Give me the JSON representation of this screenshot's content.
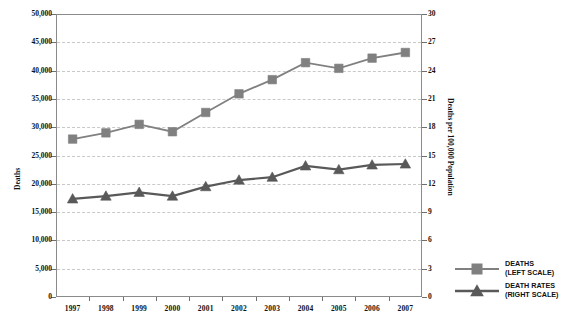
{
  "chart_data": {
    "type": "line",
    "title": "",
    "xlabel": "",
    "ylabel": "Deaths",
    "y2label": "Deaths per 100,000 Population",
    "categories": [
      "1997",
      "1998",
      "1999",
      "2000",
      "2001",
      "2002",
      "2003",
      "2004",
      "2005",
      "2006",
      "2007"
    ],
    "ylim": [
      0,
      50000
    ],
    "y2lim": [
      0,
      30
    ],
    "yticks": [
      "0",
      "5,000",
      "10,000",
      "15,000",
      "20,000",
      "25,000",
      "30,000",
      "35,000",
      "40,000",
      "45,000",
      "50,000"
    ],
    "ytick_values": [
      0,
      5000,
      10000,
      15000,
      20000,
      25000,
      30000,
      35000,
      40000,
      45000,
      50000
    ],
    "y2ticks": [
      "0",
      "3",
      "6",
      "9",
      "12",
      "15",
      "18",
      "21",
      "24",
      "27",
      "30"
    ],
    "y2tick_values": [
      0,
      3,
      6,
      9,
      12,
      15,
      18,
      21,
      24,
      27,
      30
    ],
    "grid": true,
    "legend_position": "right-bottom",
    "series": [
      {
        "name": "DEATHS",
        "scale": "left",
        "marker": "square",
        "color": "#808080",
        "values": [
          27900,
          29000,
          30500,
          29200,
          32600,
          35900,
          38400,
          41400,
          40400,
          42200,
          43200
        ]
      },
      {
        "name": "DEATH RATES",
        "scale": "right",
        "marker": "triangle",
        "color": "#595959",
        "values": [
          10.4,
          10.7,
          11.1,
          10.7,
          11.7,
          12.4,
          12.7,
          13.9,
          13.5,
          14.0,
          14.1
        ]
      }
    ]
  },
  "legend": {
    "items": [
      {
        "line1": "DEATHS",
        "line2": "(LEFT SCALE)",
        "marker": "square",
        "color": "#808080"
      },
      {
        "line1": "DEATH RATES",
        "line2": "(RIGHT SCALE)",
        "marker": "triangle",
        "color": "#595959"
      }
    ]
  },
  "colors": {
    "deaths_series": "#808080",
    "death_rates_series": "#595959",
    "grid": "#c9c9c9",
    "frame": "#8a8a8a",
    "text": "#111111"
  }
}
